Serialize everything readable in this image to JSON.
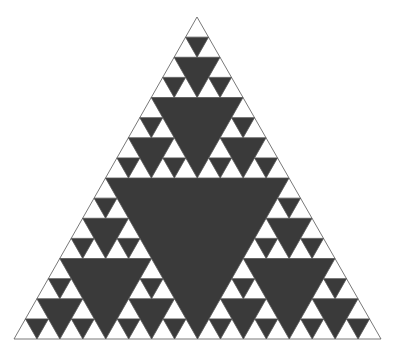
{
  "figure": {
    "depth": 4,
    "vertices": {
      "top": [
        197,
        17
      ],
      "left": [
        14,
        339
      ],
      "right": [
        381,
        339
      ]
    },
    "colors": {
      "background": "#ffffff",
      "fill_dark": "#3a3a3a",
      "fill_light": "#ffffff",
      "outline": "#555555"
    }
  }
}
